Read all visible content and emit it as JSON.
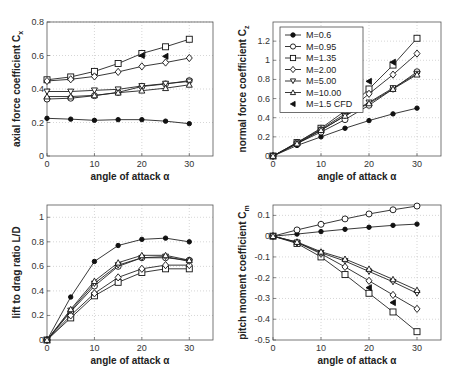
{
  "chart_data": [
    {
      "type": "line",
      "id": "cx",
      "title": "",
      "xlabel": "angle of attack α",
      "ylabel": "axial force coefficient C_x",
      "ylabel_main": "axial force coefficient C",
      "ylabel_sub": "x",
      "xlim": [
        0,
        35
      ],
      "ylim": [
        0,
        0.8
      ],
      "xticks": [
        0,
        10,
        20,
        30
      ],
      "yticks": [
        0,
        0.2,
        0.4,
        0.6,
        0.8
      ],
      "ytick_labels": [
        "0",
        "0.2",
        "0.4",
        "0.6",
        "0.8"
      ],
      "grid": true,
      "x": [
        0,
        5,
        10,
        15,
        20,
        25,
        30
      ],
      "series": [
        {
          "name": "M=0.6",
          "marker": "star",
          "values": [
            0.225,
            0.22,
            0.213,
            0.217,
            0.217,
            0.208,
            0.193
          ]
        },
        {
          "name": "M=0.95",
          "marker": "circle",
          "values": [
            0.34,
            0.345,
            0.36,
            0.38,
            0.415,
            0.43,
            0.45
          ]
        },
        {
          "name": "M=1.35",
          "marker": "square",
          "values": [
            0.455,
            0.472,
            0.505,
            0.552,
            0.612,
            0.652,
            0.697
          ]
        },
        {
          "name": "M=2.00",
          "marker": "diamond",
          "values": [
            0.448,
            0.458,
            0.475,
            0.502,
            0.535,
            0.558,
            0.585
          ]
        },
        {
          "name": "M=5.00",
          "marker": "triangle-down",
          "values": [
            0.385,
            0.385,
            0.392,
            0.398,
            0.418,
            0.432,
            0.445
          ]
        },
        {
          "name": "M=10.00",
          "marker": "triangle-up",
          "values": [
            0.355,
            0.355,
            0.362,
            0.378,
            0.39,
            0.405,
            0.425
          ]
        },
        {
          "name": "M=1.5 CFD",
          "marker": "triangle-left-filled",
          "x": [
            20,
            25
          ],
          "values": [
            0.6,
            0.595
          ]
        }
      ]
    },
    {
      "type": "line",
      "id": "cz",
      "title": "",
      "xlabel": "angle of attack α",
      "ylabel": "normal force coefficient C_z",
      "ylabel_main": "normal force coefficient C",
      "ylabel_sub": "z",
      "xlim": [
        0,
        35
      ],
      "ylim": [
        0,
        1.4
      ],
      "xticks": [
        0,
        10,
        20,
        30
      ],
      "yticks": [
        0,
        0.2,
        0.4,
        0.6,
        0.8,
        1.0,
        1.2
      ],
      "ytick_labels": [
        "0",
        "0.2",
        "0.4",
        "0.6",
        "0.8",
        "1",
        "1.2"
      ],
      "grid": true,
      "legend_position": "upper left",
      "x": [
        0,
        5,
        10,
        15,
        20,
        25,
        30
      ],
      "series": [
        {
          "name": "M=0.6",
          "marker": "star",
          "values": [
            0,
            0.11,
            0.2,
            0.29,
            0.37,
            0.44,
            0.5
          ]
        },
        {
          "name": "M=0.95",
          "marker": "circle",
          "values": [
            0,
            0.13,
            0.25,
            0.38,
            0.53,
            0.7,
            0.88
          ]
        },
        {
          "name": "M=1.35",
          "marker": "square",
          "values": [
            0,
            0.14,
            0.29,
            0.47,
            0.7,
            0.95,
            1.23
          ]
        },
        {
          "name": "M=2.00",
          "marker": "diamond",
          "values": [
            0,
            0.14,
            0.28,
            0.44,
            0.65,
            0.85,
            1.07
          ]
        },
        {
          "name": "M=5.00",
          "marker": "triangle-down",
          "values": [
            0,
            0.13,
            0.27,
            0.42,
            0.56,
            0.71,
            0.86
          ]
        },
        {
          "name": "M=10.00",
          "marker": "triangle-up",
          "values": [
            0,
            0.13,
            0.27,
            0.42,
            0.55,
            0.7,
            0.85
          ]
        },
        {
          "name": "M=1.5 CFD",
          "marker": "triangle-left-filled",
          "x": [
            20,
            25
          ],
          "values": [
            0.78,
            0.98
          ]
        }
      ]
    },
    {
      "type": "line",
      "id": "ld",
      "title": "",
      "xlabel": "angle of attack α",
      "ylabel": "lift to drag ratio L/D",
      "ylabel_main": "lift to drag ratio L/D",
      "ylabel_sub": "",
      "xlim": [
        0,
        35
      ],
      "ylim": [
        0,
        1.1
      ],
      "xticks": [
        0,
        10,
        20,
        30
      ],
      "yticks": [
        0,
        0.2,
        0.4,
        0.6,
        0.8,
        1.0
      ],
      "ytick_labels": [
        "0",
        "0.2",
        "0.4",
        "0.6",
        "0.8",
        "1"
      ],
      "grid": true,
      "x": [
        0,
        5,
        10,
        15,
        20,
        25,
        30
      ],
      "series": [
        {
          "name": "M=0.6",
          "marker": "star",
          "values": [
            0,
            0.35,
            0.64,
            0.77,
            0.82,
            0.83,
            0.8
          ]
        },
        {
          "name": "M=0.95",
          "marker": "circle",
          "values": [
            0,
            0.23,
            0.44,
            0.6,
            0.67,
            0.67,
            0.65
          ]
        },
        {
          "name": "M=1.35",
          "marker": "square",
          "values": [
            0,
            0.18,
            0.36,
            0.47,
            0.55,
            0.58,
            0.58
          ]
        },
        {
          "name": "M=2.00",
          "marker": "diamond",
          "values": [
            0,
            0.2,
            0.38,
            0.51,
            0.58,
            0.61,
            0.61
          ]
        },
        {
          "name": "M=5.00",
          "marker": "triangle-down",
          "values": [
            0,
            0.24,
            0.46,
            0.61,
            0.67,
            0.68,
            0.64
          ]
        },
        {
          "name": "M=10.00",
          "marker": "triangle-up",
          "values": [
            0,
            0.25,
            0.48,
            0.63,
            0.69,
            0.69,
            0.65
          ]
        },
        {
          "name": "M=1.5 CFD",
          "marker": "triangle-left-filled",
          "x": [],
          "values": []
        }
      ]
    },
    {
      "type": "line",
      "id": "cm",
      "title": "",
      "xlabel": "angle of attack α",
      "ylabel": "pitch moment coefficient C_m",
      "ylabel_main": "pitch moment coefficient C",
      "ylabel_sub": "m",
      "xlim": [
        0,
        35
      ],
      "ylim": [
        -0.5,
        0.15
      ],
      "xticks": [
        0,
        10,
        20,
        30
      ],
      "yticks": [
        -0.5,
        -0.4,
        -0.3,
        -0.2,
        -0.1,
        0,
        0.1
      ],
      "ytick_labels": [
        "-0.5",
        "-0.4",
        "-0.3",
        "-0.2",
        "-0.1",
        "0",
        "0.1"
      ],
      "grid": true,
      "x": [
        0,
        5,
        10,
        15,
        20,
        25,
        30
      ],
      "series": [
        {
          "name": "M=0.6",
          "marker": "star",
          "values": [
            0,
            0.01,
            0.022,
            0.033,
            0.043,
            0.052,
            0.058
          ]
        },
        {
          "name": "M=0.95",
          "marker": "circle",
          "values": [
            0,
            0.03,
            0.057,
            0.083,
            0.107,
            0.127,
            0.145
          ]
        },
        {
          "name": "M=1.35",
          "marker": "square",
          "values": [
            0,
            -0.035,
            -0.1,
            -0.185,
            -0.275,
            -0.365,
            -0.46
          ]
        },
        {
          "name": "M=2.00",
          "marker": "diamond",
          "values": [
            0,
            -0.03,
            -0.085,
            -0.148,
            -0.215,
            -0.283,
            -0.35
          ]
        },
        {
          "name": "M=5.00",
          "marker": "triangle-down",
          "values": [
            0,
            -0.03,
            -0.08,
            -0.12,
            -0.17,
            -0.22,
            -0.275
          ]
        },
        {
          "name": "M=10.00",
          "marker": "triangle-up",
          "values": [
            0,
            -0.028,
            -0.075,
            -0.11,
            -0.158,
            -0.208,
            -0.26
          ]
        },
        {
          "name": "M=1.5 CFD",
          "marker": "triangle-left-filled",
          "x": [
            20,
            25
          ],
          "values": [
            -0.248,
            -0.32
          ]
        }
      ]
    }
  ],
  "legend": {
    "entries": [
      "M=0.6",
      "M=0.95",
      "M=1.35",
      "M=2.00",
      "M=5.00",
      "M=10.00",
      "M=1.5 CFD"
    ]
  }
}
